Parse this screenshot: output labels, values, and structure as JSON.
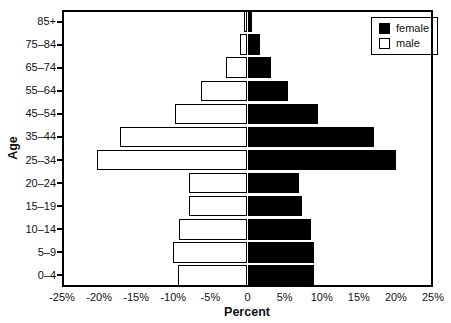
{
  "chart_data": {
    "type": "bar",
    "subtype": "population_pyramid",
    "orientation": "horizontal",
    "title": "",
    "xlabel": "Percent",
    "ylabel": "Age",
    "xlim": [
      -25,
      25
    ],
    "xtick_values": [
      -25,
      -20,
      -15,
      -10,
      -5,
      0,
      5,
      10,
      15,
      20,
      25
    ],
    "xtick_labels": [
      "-25%",
      "-20%",
      "-15%",
      "-10%",
      "-5%",
      "0",
      "5%",
      "10%",
      "15%",
      "20%",
      "25%"
    ],
    "category_order": "top_to_bottom",
    "categories": [
      "85+",
      "75–84",
      "65–74",
      "55–64",
      "45–54",
      "35–44",
      "25–34",
      "20–24",
      "15–19",
      "10–14",
      "5–9",
      "0–4"
    ],
    "series": [
      {
        "name": "female",
        "side": "right",
        "fill": "#000000",
        "values": [
          0.6,
          1.7,
          3.1,
          5.5,
          9.5,
          17.0,
          20.0,
          7.0,
          7.3,
          8.5,
          9.0,
          9.0
        ]
      },
      {
        "name": "male",
        "side": "left",
        "fill": "#ffffff",
        "plotted_as_negative": true,
        "values": [
          0.5,
          1.0,
          2.9,
          6.2,
          9.8,
          17.2,
          20.3,
          7.9,
          7.9,
          9.2,
          10.0,
          9.4
        ]
      }
    ],
    "grid": false,
    "legend_position": "top-right-inside"
  },
  "colors": {
    "background": "#ffffff",
    "bar_outline": "#000000",
    "female_fill": "#000000",
    "male_fill": "#ffffff",
    "text": "#111111"
  }
}
